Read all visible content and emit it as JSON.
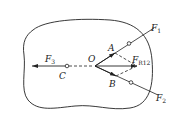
{
  "diagram": {
    "type": "rigid-body force diagram",
    "colors": {
      "stroke": "#222222",
      "background": "#ffffff"
    },
    "points": {
      "O": {
        "label": "O"
      },
      "A": {
        "label": "A"
      },
      "B": {
        "label": "B"
      },
      "C": {
        "label": "C"
      }
    },
    "forces": {
      "F1": {
        "label": "F",
        "sub": "1"
      },
      "F2": {
        "label": "F",
        "sub": "2"
      },
      "F3": {
        "label": "F",
        "sub": "3"
      },
      "FR12": {
        "label": "F",
        "sub": "R12"
      }
    }
  }
}
